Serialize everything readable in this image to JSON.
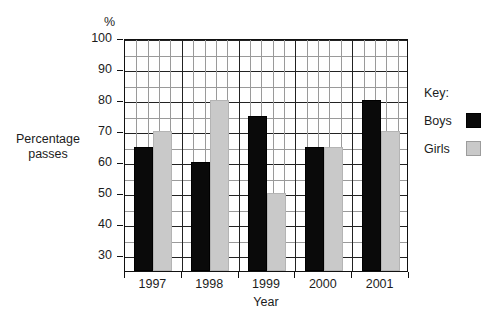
{
  "chart_data": {
    "type": "bar",
    "title": "",
    "categories": [
      "1997",
      "1998",
      "1999",
      "2000",
      "2001"
    ],
    "series": [
      {
        "name": "Boys",
        "color": "#0a0a0a",
        "values": [
          65,
          60,
          75,
          65,
          80
        ]
      },
      {
        "name": "Girls",
        "color": "#c9c9c9",
        "values": [
          70,
          80,
          50,
          65,
          70
        ]
      }
    ],
    "xlabel": "Year",
    "ylabel": "Percentage passes",
    "yunit": "%",
    "ylim": [
      25,
      100
    ],
    "ymajor_ticks": [
      30,
      40,
      50,
      60,
      70,
      80,
      90,
      100
    ],
    "yminor_step": 5,
    "grid": true,
    "legend_position": "right",
    "legend_title": "Key:"
  },
  "axes": {
    "percent_symbol": "%",
    "y_caption_line1": "Percentage",
    "y_caption_line2": "passes",
    "x_caption": "Year",
    "y_tick_labels": [
      "100",
      "90",
      "80",
      "70",
      "60",
      "50",
      "40",
      "30"
    ],
    "x_tick_labels": [
      "1997",
      "1998",
      "1999",
      "2000",
      "2001"
    ]
  },
  "legend": {
    "title": "Key:",
    "entries": [
      {
        "label": "Boys",
        "swatch": "black-square-swatch"
      },
      {
        "label": "Girls",
        "swatch": "gray-square-swatch"
      }
    ]
  }
}
